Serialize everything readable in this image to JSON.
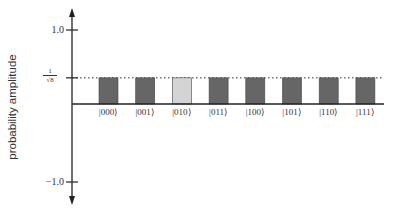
{
  "chart_data": {
    "type": "bar",
    "title": "",
    "xlabel": "",
    "ylabel": "probability amplitude",
    "categories": [
      "|000⟩",
      "|001⟩",
      "|010⟩",
      "|011⟩",
      "|100⟩",
      "|101⟩",
      "|110⟩",
      "|111⟩"
    ],
    "values": [
      0.3536,
      0.3536,
      0.3536,
      0.3536,
      0.3536,
      0.3536,
      0.3536,
      0.3536
    ],
    "highlighted_category": "|010⟩",
    "ylim": [
      -1.0,
      1.0
    ],
    "yticks": [
      "1.0",
      "1/√8",
      "-1.0"
    ],
    "reference_line": {
      "value": 0.3536,
      "label": "1/√8",
      "style": "dotted"
    },
    "grid": false,
    "legend": null,
    "colors": {
      "bar": "#666666",
      "highlight": "#d4d4d4",
      "axis": "#222222"
    }
  },
  "axis": {
    "ytick_top": "1.0",
    "ytick_bottom": "−1.0",
    "ref_num": "1",
    "ref_den": "√8"
  }
}
